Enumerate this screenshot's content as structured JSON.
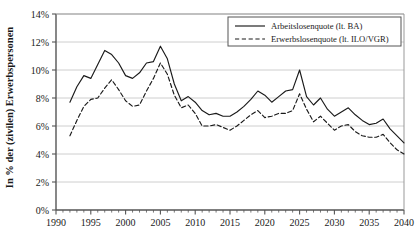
{
  "chart_data": {
    "type": "line",
    "title": "",
    "xlabel": "",
    "ylabel": "In % der (zivilen) Erwerbspersonen",
    "xlim": [
      1990,
      2040
    ],
    "ylim": [
      0,
      14
    ],
    "grid": true,
    "grid_axis": "y",
    "legend_position": "top-right",
    "y_tick_labels": [
      "0%",
      "2%",
      "4%",
      "6%",
      "8%",
      "10%",
      "12%",
      "14%"
    ],
    "y_ticks": [
      0,
      2,
      4,
      6,
      8,
      10,
      12,
      14
    ],
    "x_tick_labels": [
      "1990",
      "1995",
      "2000",
      "2005",
      "2010",
      "2015",
      "2020",
      "2025",
      "2030",
      "2035",
      "2040"
    ],
    "x_ticks": [
      1990,
      1995,
      2000,
      2005,
      2010,
      2015,
      2020,
      2025,
      2030,
      2035,
      2040
    ],
    "x_minor_tick_step": 1,
    "x": [
      1992,
      1993,
      1994,
      1995,
      1996,
      1997,
      1998,
      1999,
      2000,
      2001,
      2002,
      2003,
      2004,
      2005,
      2006,
      2007,
      2008,
      2009,
      2010,
      2011,
      2012,
      2013,
      2014,
      2015,
      2016,
      2017,
      2018,
      2019,
      2020,
      2021,
      2022,
      2023,
      2024,
      2025,
      2026,
      2027,
      2028,
      2029,
      2030,
      2031,
      2032,
      2033,
      2034,
      2035,
      2036,
      2037,
      2038,
      2039,
      2040
    ],
    "series": [
      {
        "name": "Arbeitslosenquote (lt. BA)",
        "style": "solid",
        "color": "#1a1a1a",
        "values": [
          7.7,
          8.8,
          9.6,
          9.4,
          10.4,
          11.4,
          11.1,
          10.5,
          9.6,
          9.4,
          9.8,
          10.5,
          10.6,
          11.7,
          10.8,
          9.0,
          7.8,
          8.1,
          7.7,
          7.1,
          6.8,
          6.9,
          6.7,
          6.4,
          6.1,
          5.7,
          5.2,
          5.0,
          5.9,
          5.7,
          5.3,
          5.7,
          5.9,
          6.1,
          5.8,
          5.5,
          5.3,
          5.2,
          5.0,
          4.9,
          5.2,
          5.0,
          4.8,
          4.6,
          4.7,
          4.5,
          4.2,
          4.0,
          3.8
        ]
      },
      {
        "name": "Erwerbslosenquote (lt. ILO/VGR)",
        "style": "dashed",
        "color": "#1a1a1a",
        "values": [
          5.3,
          6.4,
          7.4,
          7.9,
          8.0,
          8.7,
          9.3,
          8.6,
          7.8,
          7.4,
          7.5,
          8.5,
          9.4,
          10.5,
          9.7,
          8.2,
          7.3,
          7.5,
          6.9,
          6.0,
          6.0,
          6.1,
          5.9,
          5.7,
          5.5,
          5.1,
          4.6,
          4.4,
          5.2,
          5.0,
          4.6,
          4.9,
          5.1,
          5.3,
          5.0,
          4.8,
          4.7,
          4.6,
          4.4,
          4.3,
          4.6,
          4.4,
          4.2,
          4.0,
          4.1,
          3.9,
          3.6,
          3.4,
          3.2
        ]
      }
    ],
    "series_display": [
      {
        "name": "Arbeitslosenquote (lt. BA)",
        "style": "solid",
        "points": [
          [
            1992,
            7.7
          ],
          [
            1993,
            8.8
          ],
          [
            1994,
            9.6
          ],
          [
            1995,
            9.4
          ],
          [
            1996,
            10.4
          ],
          [
            1997,
            11.4
          ],
          [
            1998,
            11.1
          ],
          [
            1999,
            10.5
          ],
          [
            2000,
            9.6
          ],
          [
            2001,
            9.4
          ],
          [
            2002,
            9.8
          ],
          [
            2003,
            10.5
          ],
          [
            2004,
            10.6
          ],
          [
            2005,
            11.7
          ],
          [
            2006,
            10.8
          ],
          [
            2007,
            9.0
          ],
          [
            2008,
            7.8
          ],
          [
            2009,
            8.1
          ],
          [
            2010,
            7.7
          ],
          [
            2011,
            7.1
          ],
          [
            2012,
            6.8
          ],
          [
            2013,
            6.9
          ],
          [
            2014,
            6.7
          ],
          [
            2015,
            6.7
          ],
          [
            2016,
            7.0
          ],
          [
            2017,
            7.4
          ],
          [
            2018,
            7.9
          ],
          [
            2019,
            8.5
          ],
          [
            2020,
            8.2
          ],
          [
            2021,
            7.7
          ],
          [
            2022,
            8.1
          ],
          [
            2023,
            8.5
          ],
          [
            2024,
            8.6
          ],
          [
            2025,
            10.0
          ],
          [
            2026,
            8.1
          ],
          [
            2027,
            7.5
          ],
          [
            2028,
            8.0
          ],
          [
            2029,
            7.2
          ],
          [
            2030,
            6.7
          ],
          [
            2031,
            7.0
          ],
          [
            2032,
            7.3
          ],
          [
            2033,
            6.8
          ],
          [
            2034,
            6.4
          ],
          [
            2035,
            6.1
          ],
          [
            2036,
            6.2
          ],
          [
            2037,
            6.5
          ],
          [
            2038,
            5.8
          ],
          [
            2039,
            5.3
          ],
          [
            2040,
            4.8
          ]
        ]
      },
      {
        "name": "Erwerbslosenquote (lt. ILO/VGR)",
        "style": "dashed",
        "points": [
          [
            1992,
            5.3
          ],
          [
            1993,
            6.4
          ],
          [
            1994,
            7.4
          ],
          [
            1995,
            7.9
          ],
          [
            1996,
            8.0
          ],
          [
            1997,
            8.7
          ],
          [
            1998,
            9.3
          ],
          [
            1999,
            8.6
          ],
          [
            2000,
            7.8
          ],
          [
            2001,
            7.4
          ],
          [
            2002,
            7.5
          ],
          [
            2003,
            8.5
          ],
          [
            2004,
            9.4
          ],
          [
            2005,
            10.5
          ],
          [
            2006,
            9.7
          ],
          [
            2007,
            8.2
          ],
          [
            2008,
            7.3
          ],
          [
            2009,
            7.5
          ],
          [
            2010,
            6.9
          ],
          [
            2011,
            6.0
          ],
          [
            2012,
            6.0
          ],
          [
            2013,
            6.1
          ],
          [
            2014,
            5.9
          ],
          [
            2015,
            5.7
          ],
          [
            2016,
            6.0
          ],
          [
            2017,
            6.4
          ],
          [
            2018,
            6.8
          ],
          [
            2019,
            7.1
          ],
          [
            2020,
            6.6
          ],
          [
            2021,
            6.7
          ],
          [
            2022,
            6.9
          ],
          [
            2023,
            6.9
          ],
          [
            2024,
            7.1
          ],
          [
            2025,
            8.3
          ],
          [
            2026,
            7.2
          ],
          [
            2027,
            6.3
          ],
          [
            2028,
            6.7
          ],
          [
            2029,
            6.2
          ],
          [
            2030,
            5.7
          ],
          [
            2031,
            6.0
          ],
          [
            2032,
            6.1
          ],
          [
            2033,
            5.6
          ],
          [
            2034,
            5.3
          ],
          [
            2035,
            5.2
          ],
          [
            2036,
            5.2
          ],
          [
            2037,
            5.4
          ],
          [
            2038,
            4.8
          ],
          [
            2039,
            4.3
          ],
          [
            2040,
            4.0
          ]
        ]
      }
    ]
  },
  "legend": {
    "items": [
      {
        "label": "Arbeitslosenquote (lt. BA)",
        "style": "solid"
      },
      {
        "label": "Erwerbslosenquote (lt. ILO/VGR)",
        "style": "dashed"
      }
    ]
  },
  "colors": {
    "line": "#1a1a1a",
    "grid": "#c8c8c8",
    "axis": "#555555",
    "background": "#ffffff"
  }
}
